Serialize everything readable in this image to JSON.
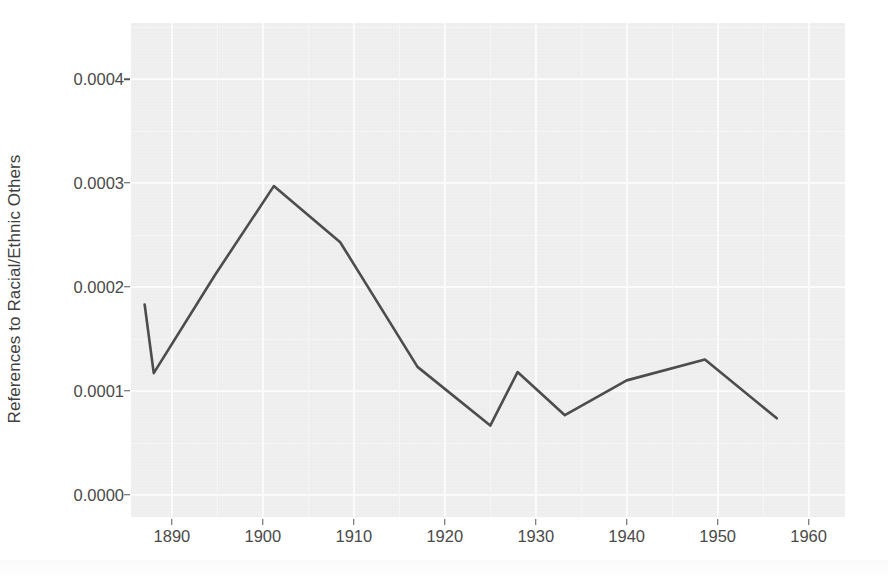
{
  "chart_data": {
    "type": "line",
    "title": "",
    "subtitle": "",
    "xlabel": "",
    "ylabel": "References to Racial/Ethnic Others",
    "xlim": [
      1885.5,
      1964.0
    ],
    "ylim": [
      -2.15e-05,
      0.000454
    ],
    "xticks": [
      1890,
      1900,
      1910,
      1920,
      1930,
      1940,
      1950,
      1960
    ],
    "xticklabels": [
      "1890",
      "1900",
      "1910",
      "1920",
      "1930",
      "1940",
      "1950",
      "1960"
    ],
    "yticks": [
      0.0,
      0.0001,
      0.0002,
      0.0003,
      0.0004
    ],
    "yticklabels": [
      "0.0000",
      "0.0001",
      "0.0002",
      "0.0003",
      "0.0004"
    ],
    "grid": true,
    "legend": "none",
    "line_color": "#4d4d4d",
    "panel_color": "#f0f0f0",
    "grid_color": "#fcfcfc",
    "series": [
      {
        "name": "References to Racial/Ethnic Others",
        "x": [
          1887.0,
          1888.0,
          1894.7,
          1901.2,
          1908.5,
          1917.0,
          1925.0,
          1928.0,
          1933.2,
          1940.0,
          1948.6,
          1956.5
        ],
        "y": [
          0.000183,
          0.000117,
          0.000211,
          0.000297,
          0.000243,
          0.000123,
          6.65e-05,
          0.000118,
          7.65e-05,
          0.00011,
          0.00013,
          7.35e-05
        ]
      }
    ]
  },
  "axis": {
    "ytick_mark_name": "y-tick-mark",
    "xtick_mark_name": "x-tick-mark"
  }
}
